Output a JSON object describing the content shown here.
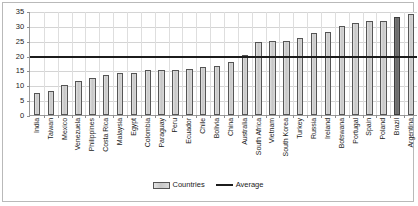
{
  "chart_data": {
    "type": "bar",
    "title": "",
    "xlabel": "",
    "ylabel": "",
    "ylim": [
      0,
      35
    ],
    "yticks": [
      0,
      5,
      10,
      15,
      20,
      25,
      30,
      35
    ],
    "grid": true,
    "legend_position": "bottom-center",
    "categories": [
      "India",
      "Taiwan",
      "Mexico",
      "Venezuela",
      "Philippines",
      "Costa Rica",
      "Malaysia",
      "Egypt",
      "Colombia",
      "Paraguay",
      "Peru",
      "Ecuador",
      "Chile",
      "Bolivia",
      "China",
      "Australia",
      "South Africa",
      "Vietnam",
      "South Korea",
      "Turkey",
      "Russia",
      "Ireland",
      "Botswana",
      "Portugal",
      "Spain",
      "Poland",
      "Brazil",
      "Argentina"
    ],
    "values": [
      7.5,
      8.0,
      10.0,
      11.5,
      12.5,
      13.5,
      14.0,
      14.0,
      15.0,
      15.0,
      15.0,
      15.5,
      16.0,
      16.5,
      18.0,
      20.3,
      24.5,
      25.0,
      25.0,
      26.0,
      27.5,
      28.0,
      30.0,
      31.0,
      31.5,
      31.5,
      33.0,
      34.0
    ],
    "series": [
      {
        "name": "Countries",
        "type": "bar",
        "color": "#c6c6c6",
        "edge_color": "#555555",
        "values": [
          7.5,
          8.0,
          10.0,
          11.5,
          12.5,
          13.5,
          14.0,
          14.0,
          15.0,
          15.0,
          15.0,
          15.5,
          16.0,
          16.5,
          18.0,
          20.3,
          24.5,
          25.0,
          25.0,
          26.0,
          27.5,
          28.0,
          30.0,
          31.0,
          31.5,
          31.5,
          33.0,
          34.0
        ],
        "highlighted_category": "Brazil",
        "highlight_color": "#696969"
      },
      {
        "name": "Average",
        "type": "line",
        "color": "#1c1c1c",
        "value": 20.0
      }
    ],
    "average_value": 20.0
  },
  "legend": {
    "entries": [
      {
        "label": "Countries",
        "marker": "bar-swatch-icon"
      },
      {
        "label": "Average",
        "marker": "line-swatch-icon"
      }
    ]
  }
}
